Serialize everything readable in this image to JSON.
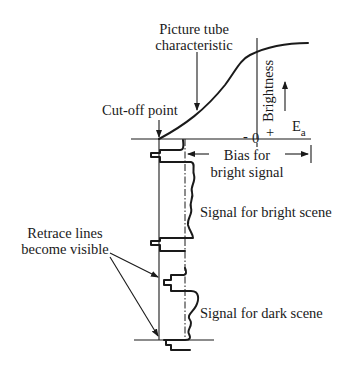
{
  "diagram": {
    "labels": {
      "curve_title_line1": "Picture tube",
      "curve_title_line2": "characteristic",
      "cutoff": "Cut-off point",
      "brightness": "Brightness",
      "minus": "-",
      "zero": "0",
      "plus": "+",
      "ea_main": "E",
      "ea_sub": "a",
      "bias_line1": "Bias for",
      "bias_line2": "bright signal",
      "bright_scene": "Signal for bright scene",
      "retrace_line1": "Retrace lines",
      "retrace_line2": "become visible",
      "dark_scene": "Signal for dark scene"
    },
    "colors": {
      "ink": "#1a1a1a",
      "background": "#ffffff"
    }
  }
}
